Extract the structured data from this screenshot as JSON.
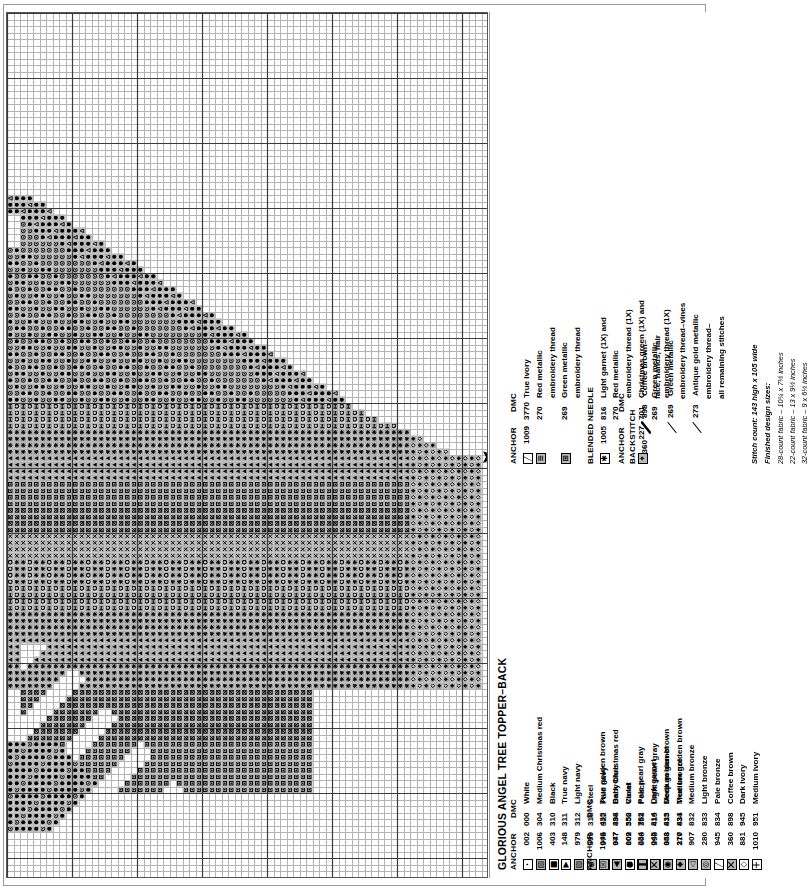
{
  "document": {
    "title": "GLORIOUS ANGEL TREE TOPPER–BACK",
    "type": "cross-stitch-pattern-chart"
  },
  "chart": {
    "grid_label": "cross-stitch-grid",
    "center_marker": "center-arrow-marker",
    "columns": 74,
    "rows": 133,
    "cell_px": 6.5,
    "major_every": 10
  },
  "legend_main": {
    "header_anchor": "ANCHOR",
    "header_dmc": "DMC",
    "col1": [
      {
        "symbol": "·",
        "anchor": "002",
        "dmc": "000",
        "name": "White",
        "fill": "white"
      },
      {
        "symbol": "▨",
        "anchor": "1006",
        "dmc": "304",
        "name": "Medium Christmas red",
        "fill": "gray"
      },
      {
        "symbol": "■",
        "anchor": "403",
        "dmc": "310",
        "name": "Black",
        "fill": "white"
      },
      {
        "symbol": "▶",
        "anchor": "148",
        "dmc": "311",
        "name": "True navy",
        "fill": "white"
      },
      {
        "symbol": "▧",
        "anchor": "979",
        "dmc": "312",
        "name": "Light navy",
        "fill": "gray"
      },
      {
        "symbol": "⊛",
        "anchor": "399",
        "dmc": "318",
        "name": "Steel",
        "fill": "gray"
      },
      {
        "symbol": "▷",
        "anchor": "978",
        "dmc": "322",
        "name": "Pale navy",
        "fill": "white"
      },
      {
        "symbol": "—",
        "anchor": "977",
        "dmc": "334",
        "name": "Baby blue",
        "fill": "white"
      },
      {
        "symbol": "⊡",
        "anchor": "009",
        "dmc": "352",
        "name": "Coral",
        "fill": "white"
      },
      {
        "symbol": "‖",
        "anchor": "008",
        "dmc": "353",
        "name": "Peach",
        "fill": "gray"
      },
      {
        "symbol": "○",
        "anchor": "398",
        "dmc": "415",
        "name": "Light pearl gray",
        "fill": "white"
      },
      {
        "symbol": "✶",
        "anchor": "358",
        "dmc": "433",
        "name": "Deep golden brown",
        "fill": "gray"
      },
      {
        "symbol": "❖",
        "anchor": "310",
        "dmc": "434",
        "name": "Medium golden brown",
        "fill": "gray"
      }
    ],
    "col2": [
      {
        "symbol": "☒",
        "anchor": "1046",
        "dmc": "435",
        "name": "True golden brown",
        "fill": "gray"
      },
      {
        "symbol": "◀",
        "anchor": "047",
        "dmc": "498",
        "name": "Dark Christmas red",
        "fill": "gray"
      },
      {
        "symbol": "●",
        "anchor": "102",
        "dmc": "550",
        "name": "Violet",
        "fill": "white"
      },
      {
        "symbol": "│",
        "anchor": "234",
        "dmc": "762",
        "name": "Pale pearl gray",
        "fill": "white"
      },
      {
        "symbol": "⨉",
        "anchor": "045",
        "dmc": "814",
        "name": "Dark garnet",
        "fill": "gray"
      },
      {
        "symbol": "◉",
        "anchor": "043",
        "dmc": "815",
        "name": "Medium garnet",
        "fill": "white"
      },
      {
        "symbol": "✦",
        "anchor": "277",
        "dmc": "831",
        "name": "True bronze",
        "fill": "white"
      },
      {
        "symbol": "◁",
        "anchor": "907",
        "dmc": "832",
        "name": "Medium bronze",
        "fill": "gray"
      },
      {
        "symbol": "◎",
        "anchor": "280",
        "dmc": "833",
        "name": "Light bronze",
        "fill": "gray"
      },
      {
        "symbol": "╱",
        "anchor": "945",
        "dmc": "834",
        "name": "Pale bronze",
        "fill": "white"
      },
      {
        "symbol": "⨉",
        "anchor": "360",
        "dmc": "898",
        "name": "Coffee brown",
        "fill": "gray"
      },
      {
        "symbol": "◇",
        "anchor": "881",
        "dmc": "945",
        "name": "Dark ivory",
        "fill": "white"
      },
      {
        "symbol": "＋",
        "anchor": "1010",
        "dmc": "951",
        "name": "Medium ivory",
        "fill": "white"
      }
    ]
  },
  "legend_special": {
    "header_anchor": "ANCHOR",
    "header_dmc": "DMC",
    "rows": [
      {
        "symbol": "╱",
        "anchor": "1009",
        "dmc": "3770",
        "name": "True ivory",
        "fill": "white"
      },
      {
        "symbol": "≡",
        "anchor": "",
        "dmc": "270",
        "name": "Red metallic",
        "name2": "embroidery thread",
        "fill": "gray"
      },
      {
        "symbol": "⊞",
        "anchor": "",
        "dmc": "269",
        "name": "Green metallic",
        "name2": "embroidery thread",
        "fill": "gray"
      }
    ],
    "blended_heading": "BLENDED NEEDLE",
    "blended": [
      {
        "symbol": "✱",
        "anchor": "1005",
        "dmc": "816",
        "name": "Light garnet (1X) and",
        "fill": "white",
        "extra": [
          {
            "dmc": "270",
            "name": "Red metallic"
          },
          {
            "dmc": "",
            "name": "embroidery thread (1X)"
          }
        ]
      },
      {
        "symbol": "✦",
        "anchor": "227",
        "dmc": "701",
        "name": "Christmas green (1X) and",
        "fill": "gray",
        "extra": [
          {
            "dmc": "269",
            "name": "Green metallic"
          },
          {
            "dmc": "",
            "name": "embroidery thread (1X)"
          }
        ]
      }
    ]
  },
  "legend_backstitch": {
    "header_anchor": "ANCHOR",
    "header_dmc": "DMC",
    "heading": "BACKSTITCH",
    "rows": [
      {
        "anchor": "360",
        "dmc": "898",
        "name": "Coffee brown–",
        "name2": "face, hands, hair",
        "weight": "thick"
      },
      {
        "anchor": "",
        "dmc": "269",
        "name": "Green metallic",
        "name2": "embroidery thread–vines",
        "weight": "thin"
      },
      {
        "anchor": "",
        "dmc": "273",
        "name": "Antique gold metallic",
        "name2": "embroidery thread–",
        "name3": "all remaining stitches",
        "weight": "thin"
      }
    ]
  },
  "specs": {
    "stitch_count": "Stitch count: 143 high x 105 wide",
    "sizes_heading": "Finished design sizes:",
    "sizes": [
      "28-count fabric – 10¼ x 7½ inches",
      "22-count fabric – 13 x 9½ inches",
      "32-count fabric –  9  x  6½ inches"
    ]
  },
  "colors": {
    "grid_minor": "#b4b4b4",
    "grid_major": "#3a3a3a",
    "shade_light": "#c3c3c3",
    "shade_mid": "#a8a8a8",
    "shade_dark": "#8a8a8a",
    "ink": "#000000"
  }
}
